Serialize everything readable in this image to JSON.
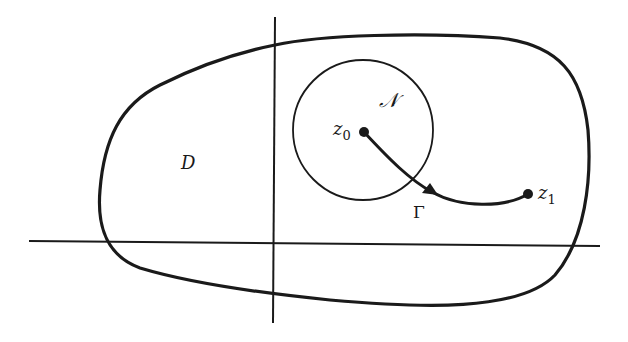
{
  "diagram": {
    "type": "complex-domain-path",
    "colors": {
      "ink": "#1a1a1a",
      "background": "#ffffff"
    },
    "labels": {
      "domain": "D",
      "neighborhood": "𝒩",
      "start_point_base": "z",
      "start_point_sub": "0",
      "end_point_base": "z",
      "end_point_sub": "1",
      "path": "Γ"
    },
    "axes": {
      "vertical": {
        "x": 273,
        "y_start": 17,
        "y_end": 323
      },
      "horizontal": {
        "y_left": 241,
        "y_right": 246,
        "x_start": 29,
        "x_end": 600
      }
    },
    "neighborhood_circle": {
      "cx": 363,
      "cy": 130,
      "r": 70
    },
    "points": {
      "z0": {
        "x": 364,
        "y": 132
      },
      "z1": {
        "x": 528,
        "y": 194
      }
    }
  }
}
